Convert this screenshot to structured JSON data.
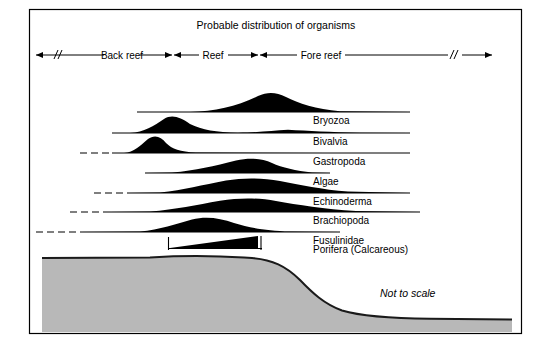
{
  "figure": {
    "title": "Probable distribution of organisms",
    "note": "Not to scale",
    "colors": {
      "frame": "#000000",
      "curve_fill": "#000000",
      "baseline": "#000000",
      "seafloor_fill": "#b8b8b8",
      "seafloor_outline": "#1a1a1a",
      "background": "#ffffff"
    }
  },
  "zones": [
    {
      "label": "Back reef",
      "start_x": 36,
      "end_x": 172,
      "break_mark": "//",
      "break_x": 56,
      "left_arrow": true,
      "right_arrow": true
    },
    {
      "label": "Reef",
      "start_x": 174,
      "end_x": 258,
      "break_mark": "",
      "break_x": 0,
      "left_arrow": true,
      "right_arrow": true
    },
    {
      "label": "Fore reef",
      "start_x": 260,
      "end_x": 492,
      "break_mark": "//",
      "break_x": 452,
      "left_arrow": true,
      "right_arrow": true
    }
  ],
  "organisms": [
    {
      "label": "Bryozoa",
      "baseline_y": 112,
      "line_start_x": 137,
      "line_end_x": 410,
      "dashed_start_x": null,
      "dashed_end_x": null,
      "peak_x": 266,
      "peak_height": 20,
      "label_x": 313,
      "label_y": 115,
      "abundance_profile": "low in back reef, rising through reef, maximum in fore reef",
      "shape": "curve"
    },
    {
      "label": "Bivalvia",
      "baseline_y": 133,
      "line_start_x": 112,
      "line_end_x": 410,
      "dashed_start_x": null,
      "dashed_end_x": null,
      "peak_x": 166,
      "peak_height": 15,
      "secondary_peak_x": 288,
      "secondary_peak_height": 3,
      "label_x": 313,
      "label_y": 136,
      "abundance_profile": "maximum in back reef, minor secondary rise in fore reef",
      "shape": "curve"
    },
    {
      "label": "Gastropoda",
      "baseline_y": 153,
      "line_start_x": 112,
      "line_end_x": 410,
      "dashed_start_x": 80,
      "dashed_end_x": 112,
      "peak_x": 147,
      "peak_height": 16,
      "label_x": 313,
      "label_y": 156,
      "abundance_profile": "maximum in back reef near reef crest, uncertain far back reef",
      "shape": "curve"
    },
    {
      "label": "Algae",
      "baseline_y": 173,
      "line_start_x": 145,
      "line_end_x": 330,
      "dashed_start_x": null,
      "dashed_end_x": null,
      "peak_x": 243,
      "peak_height": 15,
      "label_x": 313,
      "label_y": 176,
      "abundance_profile": "maximum across reef and proximal fore reef",
      "shape": "curve"
    },
    {
      "label": "Echinoderma",
      "baseline_y": 193,
      "line_start_x": 128,
      "line_end_x": 410,
      "dashed_start_x": 94,
      "dashed_end_x": 128,
      "peak_x": 250,
      "peak_height": 15,
      "label_x": 313,
      "label_y": 196,
      "abundance_profile": "broad maximum over reef and fore reef",
      "shape": "curve"
    },
    {
      "label": "Brachiopoda",
      "baseline_y": 212,
      "line_start_x": 110,
      "line_end_x": 420,
      "dashed_start_x": 70,
      "dashed_end_x": 110,
      "peak_x": 248,
      "peak_height": 13,
      "label_x": 313,
      "label_y": 215,
      "abundance_profile": "maximum over reef front, tapering into fore reef",
      "shape": "curve"
    },
    {
      "label": "Fusulinidae",
      "baseline_y": 232,
      "line_start_x": 80,
      "line_end_x": 340,
      "dashed_start_x": 36,
      "dashed_end_x": 80,
      "peak_x": 195,
      "peak_height": 13,
      "label_x": 313,
      "label_y": 235,
      "abundance_profile": "maximum in reef zone, dashed extension into back reef",
      "shape": "curve"
    },
    {
      "label": "Porifera (Calcareous)",
      "baseline_y": 252,
      "line_start_x": 168,
      "line_end_x": 262,
      "dashed_start_x": null,
      "dashed_end_x": null,
      "peak_x": 258,
      "peak_height": 16,
      "label_x": 313,
      "label_y": 255,
      "abundance_profile": "wedge increasing from reef interior to reef crest",
      "shape": "wedge"
    }
  ],
  "seafloor": {
    "description": "reef platform cross-section dropping to deep fore reef basin",
    "platform_top_y": 256,
    "platform_left_x": 42,
    "slope_start_x": 252,
    "slope_end_x": 352,
    "basin_top_y": 318,
    "basin_right_x": 512,
    "bottom_y": 332,
    "note_x": 380,
    "note_y": 297
  },
  "frame": {
    "left": 29,
    "top": 9,
    "right": 522,
    "bottom": 334
  }
}
